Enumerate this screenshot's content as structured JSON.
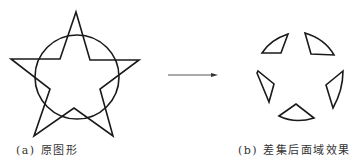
{
  "figure": {
    "left_panel": {
      "caption": "(a) 原图形",
      "shapes": [
        "five-pointed-star",
        "circle"
      ]
    },
    "arrow": {
      "direction": "right"
    },
    "right_panel": {
      "caption": "(b) 差集后面域效果",
      "shapes": [
        "five-region-fragments"
      ]
    },
    "colors": {
      "stroke": "#1a1a1a",
      "background": "#ffffff"
    }
  }
}
